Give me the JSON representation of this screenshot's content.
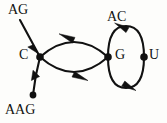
{
  "diagram": {
    "type": "directed-graph",
    "background_color": "#fdfdfb",
    "stroke_color": "#111111",
    "nodes": [
      {
        "id": "C",
        "label": "C",
        "x": 40,
        "y": 57,
        "label_side": "left"
      },
      {
        "id": "G",
        "label": "G",
        "x": 108,
        "y": 57,
        "label_side": "right"
      },
      {
        "id": "U",
        "label": "U",
        "x": 144,
        "y": 57,
        "label_side": "right"
      },
      {
        "id": "terminal_AAG",
        "label": "",
        "x": 33,
        "y": 95,
        "label_side": "none"
      }
    ],
    "edge_labels": [
      {
        "id": "AG",
        "label": "AG",
        "x": 8,
        "y": 3
      },
      {
        "id": "AAG",
        "label": "AAG",
        "x": 5,
        "y": 103
      },
      {
        "id": "AC",
        "label": "AC",
        "x": 107,
        "y": 10
      }
    ],
    "edges": [
      {
        "id": "ag-to-c",
        "from": "AG",
        "to": "C",
        "shape": "straight",
        "arrow_direction": "down-right"
      },
      {
        "id": "c-to-aag",
        "from": "C",
        "to": "AAG",
        "shape": "straight",
        "arrow_direction": "down-left"
      },
      {
        "id": "g-to-c-top",
        "from": "G",
        "to": "C",
        "shape": "arc-upper",
        "arrow_direction": "left"
      },
      {
        "id": "c-to-g-bottom",
        "from": "C",
        "to": "G",
        "shape": "arc-lower",
        "arrow_direction": "right"
      },
      {
        "id": "u-to-g-top",
        "from": "U",
        "to": "G",
        "shape": "arc-upper",
        "arrow_direction": "left"
      },
      {
        "id": "g-to-u-bottom",
        "from": "G",
        "to": "U",
        "shape": "arc-lower",
        "arrow_direction": "right"
      }
    ]
  }
}
